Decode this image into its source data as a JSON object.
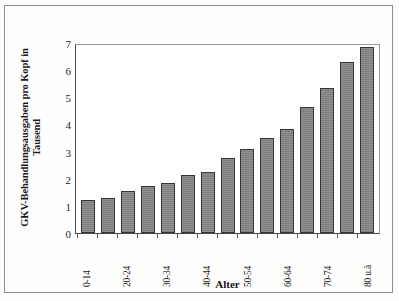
{
  "chart_data": {
    "type": "bar",
    "title": "",
    "xlabel": "Alter",
    "ylabel_line1": "GKV-Behandlungsausgaben pro Kopf in",
    "ylabel_line2": "Tausend",
    "ylim": [
      0,
      7
    ],
    "yticks": [
      7,
      6,
      5,
      4,
      3,
      2,
      1,
      0
    ],
    "grid": false,
    "legend": "none",
    "bar_color": "#848484",
    "bar_edge_color": "#353535",
    "categories": [
      "0-14",
      "15-19",
      "20-24",
      "25-29",
      "30-34",
      "35-39",
      "40-44",
      "45-49",
      "50-54",
      "55-59",
      "60-64",
      "65-69",
      "70-74",
      "75-79",
      "80 u.ä"
    ],
    "tick_labels": [
      "0-14",
      "",
      "20-24",
      "",
      "30-34",
      "",
      "40-44",
      "",
      "50-54",
      "",
      "60-64",
      "",
      "70-74",
      "",
      "80 u.ä"
    ],
    "values": [
      1.2,
      1.3,
      1.55,
      1.75,
      1.85,
      2.15,
      2.25,
      2.75,
      3.1,
      3.5,
      3.85,
      4.65,
      5.35,
      6.3,
      6.85
    ]
  }
}
